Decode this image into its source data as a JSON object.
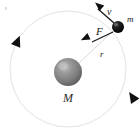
{
  "figure": {
    "width": 139,
    "height": 137,
    "background_color": "#ffffff"
  },
  "orbit": {
    "name": "orbit-path",
    "center_x": 68,
    "center_y": 69,
    "radius": 58,
    "stroke_color": "#e2e2e2",
    "stroke_width": 1,
    "direction": "counterclockwise",
    "direction_markers": [
      {
        "label": "left-orbit-arrowhead",
        "x": 14,
        "y": 50,
        "rotation": -74
      },
      {
        "label": "bottom-right-orbit-arrowhead",
        "x": 124,
        "y": 99,
        "rotation": 118
      }
    ]
  },
  "central_body": {
    "name": "central-mass",
    "label": "M",
    "x": 68,
    "y": 72,
    "radius": 14,
    "fill_color": "#8a8a8a",
    "highlight_color": "#b8b8b8",
    "shadow_color": "#585858",
    "label_x": 66,
    "label_y": 101,
    "label_size": 12
  },
  "orbiting_body": {
    "name": "orbiting-mass",
    "label": "m",
    "x": 118,
    "y": 27,
    "radius": 6,
    "fill_color": "#111111",
    "highlight_color": "#5a5a5a",
    "label_x": 127,
    "label_y": 20,
    "label_size": 9
  },
  "vectors": [
    {
      "name": "velocity-vector",
      "label": "v",
      "symbol": "v",
      "from_x": 114,
      "from_y": 23,
      "to_x": 95,
      "to_y": 6,
      "stroke_color": "#1a1a1a",
      "stroke_width": 1.3,
      "label_x": 108,
      "label_y": 13,
      "label_size": 10,
      "description": "tangential velocity of orbiting mass"
    },
    {
      "name": "force-vector",
      "label": "F",
      "symbol": "F",
      "from_x": 113,
      "from_y": 32,
      "to_x": 89,
      "to_y": 44,
      "stroke_color": "#1a1a1a",
      "stroke_width": 1.3,
      "label_x": 98,
      "label_y": 34,
      "label_size": 10,
      "description": "gravitational force toward central mass"
    }
  ],
  "radius_line": {
    "name": "radius-line",
    "label": "r",
    "from_x": 78,
    "from_y": 64,
    "to_x": 113,
    "to_y": 31,
    "stroke_color": "#d6d6d6",
    "stroke_width": 1,
    "label_x": 101,
    "label_y": 55,
    "label_size": 9,
    "description": "orbital radius between M and m"
  },
  "artifacts": [
    {
      "name": "corner-speck",
      "x": 5,
      "y": 7,
      "width": 2,
      "height": 3
    }
  ]
}
